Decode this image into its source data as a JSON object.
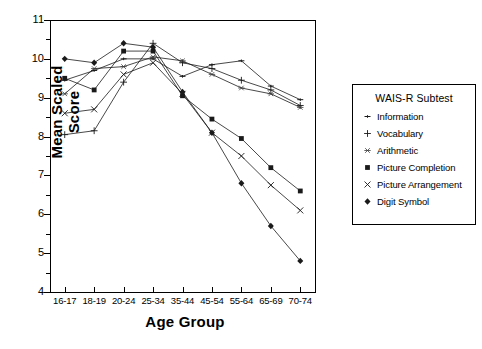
{
  "chart_data": {
    "type": "line",
    "title": "",
    "xlabel": "Age Group",
    "ylabel": "Mean Scaled Score",
    "categories": [
      "16-17",
      "18-19",
      "20-24",
      "25-34",
      "35-44",
      "45-54",
      "55-64",
      "65-69",
      "70-74"
    ],
    "ylim": [
      4,
      11
    ],
    "yticks": [
      4,
      5,
      6,
      7,
      8,
      9,
      10,
      11
    ],
    "ytick_labels": [
      "4",
      "5",
      "6",
      "7",
      "8",
      "9",
      "10",
      "11"
    ],
    "grid": false,
    "legend_position": "right",
    "legend_title": "WAIS-R Subtest",
    "series": [
      {
        "name": "Information",
        "marker": "dash",
        "values": [
          9.45,
          9.7,
          10.0,
          10.0,
          9.55,
          9.85,
          9.95,
          9.3,
          8.95
        ]
      },
      {
        "name": "Vocabulary",
        "marker": "plus",
        "values": [
          8.05,
          8.15,
          9.4,
          10.4,
          9.9,
          9.75,
          9.45,
          9.2,
          8.8
        ]
      },
      {
        "name": "Arithmetic",
        "marker": "star",
        "values": [
          9.1,
          9.75,
          9.8,
          10.05,
          9.95,
          9.6,
          9.25,
          9.1,
          8.75
        ]
      },
      {
        "name": "Picture Completion",
        "marker": "square",
        "values": [
          9.5,
          9.2,
          10.2,
          10.2,
          9.05,
          8.45,
          7.95,
          7.2,
          6.6
        ]
      },
      {
        "name": "Picture Arrangement",
        "marker": "cross",
        "values": [
          8.6,
          8.7,
          9.6,
          9.9,
          9.1,
          8.1,
          7.5,
          6.75,
          6.1
        ]
      },
      {
        "name": "Digit Symbol",
        "marker": "diamond",
        "values": [
          10.0,
          9.9,
          10.4,
          10.3,
          9.15,
          8.1,
          6.8,
          5.7,
          4.8
        ]
      }
    ]
  },
  "axes": {
    "y_title": "Mean Scaled Score",
    "x_title": "Age Group"
  },
  "legend": {
    "title": "WAIS-R Subtest",
    "entries": [
      {
        "label": "Information",
        "icon": "dash-marker-icon"
      },
      {
        "label": "Vocabulary",
        "icon": "plus-marker-icon"
      },
      {
        "label": "Arithmetic",
        "icon": "star-marker-icon"
      },
      {
        "label": "Picture Completion",
        "icon": "square-marker-icon"
      },
      {
        "label": "Picture Arrangement",
        "icon": "cross-marker-icon"
      },
      {
        "label": "Digit Symbol",
        "icon": "diamond-marker-icon"
      }
    ]
  },
  "colors": {
    "ink": "#1a1a1a",
    "background": "#ffffff"
  }
}
